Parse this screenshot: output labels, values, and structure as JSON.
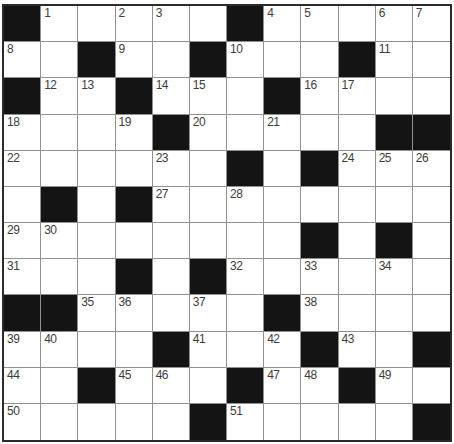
{
  "puzzle": {
    "name": "crossword-grid",
    "rows": 12,
    "cols": 12,
    "grid": [
      [
        "B",
        "1",
        "",
        "2",
        "3",
        "",
        "B",
        "4",
        "5",
        "",
        "6",
        "7"
      ],
      [
        "8",
        "",
        "B",
        "9",
        "",
        "B",
        "10",
        "",
        "",
        "B",
        "11",
        ""
      ],
      [
        "B",
        "12",
        "13",
        "B",
        "14",
        "15",
        "",
        "B",
        "16",
        "17",
        "",
        ""
      ],
      [
        "18",
        "",
        "",
        "19",
        "B",
        "20",
        "",
        "21",
        "",
        "",
        "B",
        "B"
      ],
      [
        "22",
        "",
        "",
        "",
        "23",
        "",
        "B",
        "",
        "B",
        "24",
        "25",
        "26"
      ],
      [
        "",
        "B",
        "",
        "B",
        "27",
        "",
        "28",
        "",
        "",
        "",
        "",
        ""
      ],
      [
        "29",
        "30",
        "",
        "",
        "",
        "",
        "",
        "",
        "B",
        "",
        "B",
        ""
      ],
      [
        "31",
        "",
        "",
        "B",
        "",
        "B",
        "32",
        "",
        "33",
        "",
        "34",
        ""
      ],
      [
        "B",
        "B",
        "35",
        "36",
        "",
        "37",
        "",
        "B",
        "38",
        "",
        "",
        ""
      ],
      [
        "39",
        "40",
        "",
        "",
        "B",
        "41",
        "",
        "42",
        "B",
        "43",
        "",
        "B"
      ],
      [
        "44",
        "",
        "B",
        "45",
        "46",
        "",
        "B",
        "47",
        "48",
        "B",
        "49",
        ""
      ],
      [
        "50",
        "",
        "",
        "",
        "",
        "B",
        "51",
        "",
        "",
        "",
        "",
        "B"
      ]
    ],
    "colors": {
      "black_cell": "#141414",
      "white_cell": "#ffffff",
      "grid_line": "#919191",
      "outer_border": "#2b2b2b",
      "number_color": "#3c3c3c",
      "page_background": "#ffffff"
    }
  }
}
